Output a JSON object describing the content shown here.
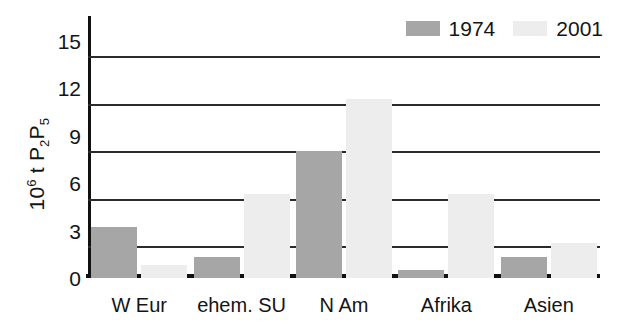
{
  "chart_data": {
    "type": "bar",
    "title": "",
    "xlabel": "",
    "ylabel": "10⁶ t P₂P₅",
    "ylabel_parts": {
      "prefix": "10",
      "exponent": "6",
      "middle": " t P",
      "sub1": "2",
      "letter2": "P",
      "sub2": "5"
    },
    "categories": [
      "W Eur",
      "ehem. SU",
      "N Am",
      "Afrika",
      "Asien"
    ],
    "series": [
      {
        "name": "1974",
        "color": "#a6a6a6",
        "values": [
          3.2,
          1.3,
          8.0,
          0.5,
          1.3
        ]
      },
      {
        "name": "2001",
        "color": "#ededed",
        "values": [
          0.8,
          5.3,
          11.3,
          5.3,
          2.2
        ]
      }
    ],
    "ylim": [
      0,
      15.8
    ],
    "ytick_labels": [
      "15",
      "12",
      "9",
      "6",
      "3",
      "0"
    ],
    "ytick_values": [
      15,
      12,
      9,
      6,
      3,
      0
    ],
    "gridline_values": [
      14,
      11,
      8,
      5,
      2
    ],
    "grid": true,
    "legend_position": "top-right"
  },
  "legend": {
    "entries": [
      {
        "label": "1974",
        "swatch_color": "#a6a6a6"
      },
      {
        "label": "2001",
        "swatch_color": "#ededed"
      }
    ]
  }
}
